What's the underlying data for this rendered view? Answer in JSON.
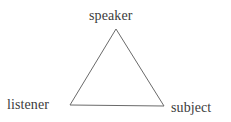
{
  "diagram": {
    "type": "triangle-diagram",
    "background_color": "#ffffff",
    "stroke_color": "#6a6a6a",
    "stroke_width": 1,
    "text_color": "#3c3c3c",
    "vertices": [
      {
        "id": "apex",
        "label": "speaker",
        "x": 116,
        "y": 29
      },
      {
        "id": "bottom-left",
        "label": "listener",
        "x": 70,
        "y": 105
      },
      {
        "id": "bottom-right",
        "label": "subject",
        "x": 164,
        "y": 106
      }
    ],
    "labels": {
      "speaker": "speaker",
      "listener": "listener",
      "subject": "subject"
    }
  }
}
